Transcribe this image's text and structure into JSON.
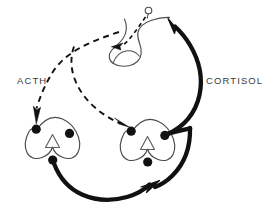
{
  "diagram": {
    "type": "hpa-axis-feedback-loop",
    "background_color": "#ffffff",
    "stroke_color": "#111111",
    "thin_stroke_color": "#3f3f3f",
    "labels": {
      "acth": "ACTH",
      "cortisol": "CORTISOL"
    },
    "organs": [
      {
        "name": "pituitary-gland",
        "role": "hormone-source",
        "position": "top-center"
      },
      {
        "name": "adrenal-gland-left",
        "role": "hormone-target",
        "position": "bottom-left",
        "node_count": 3
      },
      {
        "name": "adrenal-gland-right",
        "role": "hormone-target",
        "position": "bottom-center",
        "node_count": 3
      }
    ],
    "pathways": [
      {
        "name": "acth-to-left-adrenal",
        "style": "dashed",
        "label": "ACTH",
        "from": "pituitary-gland",
        "to": "adrenal-gland-left"
      },
      {
        "name": "acth-to-right-adrenal",
        "style": "dashed",
        "label": "ACTH",
        "from": "pituitary-gland",
        "to": "adrenal-gland-right"
      },
      {
        "name": "cortisol-to-pituitary",
        "style": "solid-thick",
        "label": "CORTISOL",
        "from": "adrenal-gland-right",
        "to": "pituitary-gland"
      },
      {
        "name": "cortisol-left-to-right",
        "style": "solid-thick",
        "label": "CORTISOL",
        "from": "adrenal-gland-left",
        "to": "cortisol-to-pituitary"
      },
      {
        "name": "feedback-into-pituitary",
        "style": "dashed-short",
        "from": "releasing-factor",
        "to": "pituitary-gland"
      }
    ]
  }
}
